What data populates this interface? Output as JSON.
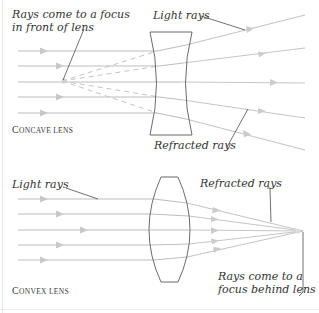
{
  "concave": {
    "caption_first": "C",
    "caption_rest": "oncave lens",
    "label_focus_line1": "Rays come to a focus",
    "label_focus_line2": "in front of lens",
    "label_light": "Light rays",
    "label_refracted": "Refracted rays"
  },
  "convex": {
    "caption_first": "C",
    "caption_rest": "onvex lens",
    "label_light": "Light rays",
    "label_refracted": "Refracted rays",
    "label_focus_line1": "Rays come to a",
    "label_focus_line2": "focus behind lens"
  },
  "colors": {
    "ray": "#b8b8b8",
    "lens": "#555555",
    "leader": "#333333",
    "text": "#333333"
  }
}
